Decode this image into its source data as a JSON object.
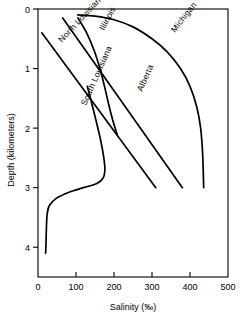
{
  "chart_data": {
    "type": "line",
    "title": "",
    "xlabel": "Salinity (‰)",
    "ylabel": "Depth (kilometers)",
    "xlim": [
      0,
      500
    ],
    "ylim": [
      0,
      4.5
    ],
    "y_inverted": true,
    "grid": false,
    "legend": "none",
    "legend_position": "inline-curve-labels",
    "xticks": [
      0,
      100,
      200,
      300,
      400,
      500
    ],
    "xtick_labels": [
      "0",
      "100",
      "200",
      "300",
      "400",
      "500"
    ],
    "yticks": [
      0,
      1,
      2,
      3,
      4
    ],
    "ytick_labels": [
      "0",
      "1",
      "2",
      "3",
      "4"
    ],
    "series": [
      {
        "name": "Michigan",
        "label": "Michigan",
        "label_angle": -52,
        "points": [
          [
            105,
            0.1
          ],
          [
            150,
            0.12
          ],
          [
            200,
            0.18
          ],
          [
            250,
            0.3
          ],
          [
            300,
            0.5
          ],
          [
            340,
            0.72
          ],
          [
            375,
            1.0
          ],
          [
            400,
            1.3
          ],
          [
            418,
            1.65
          ],
          [
            428,
            2.0
          ],
          [
            433,
            2.4
          ],
          [
            435,
            2.75
          ],
          [
            436,
            3.0
          ]
        ]
      },
      {
        "name": "Illinois",
        "label": "Illinois",
        "label_angle": -62,
        "points": [
          [
            105,
            0.15
          ],
          [
            128,
            0.4
          ],
          [
            148,
            0.7
          ],
          [
            163,
            1.0
          ],
          [
            175,
            1.3
          ],
          [
            186,
            1.6
          ],
          [
            196,
            1.85
          ],
          [
            208,
            2.1
          ]
        ]
      },
      {
        "name": "Alberta",
        "label": "Alberta",
        "label_angle": -66,
        "points": [
          [
            65,
            0.15
          ],
          [
            380,
            3.0
          ]
        ]
      },
      {
        "name": "North Louisiana",
        "label": "North Louisiana",
        "label_angle": -47,
        "points": [
          [
            10,
            0.4
          ],
          [
            310,
            3.0
          ]
        ]
      },
      {
        "name": "South Louisiana",
        "label": "South Louisiana",
        "label_angle": -66,
        "points": [
          [
            130,
            1.3
          ],
          [
            148,
            1.75
          ],
          [
            163,
            2.15
          ],
          [
            172,
            2.45
          ],
          [
            176,
            2.68
          ],
          [
            172,
            2.83
          ],
          [
            155,
            2.93
          ],
          [
            120,
            3.0
          ],
          [
            80,
            3.08
          ],
          [
            48,
            3.18
          ],
          [
            30,
            3.3
          ],
          [
            24,
            3.45
          ],
          [
            22,
            3.7
          ],
          [
            21,
            3.95
          ],
          [
            20,
            4.1
          ]
        ]
      }
    ]
  },
  "axes": {
    "x_axis_name": "salinity-axis",
    "y_axis_name": "depth-axis"
  },
  "artifacts": {
    "stray_mark": "‘"
  }
}
